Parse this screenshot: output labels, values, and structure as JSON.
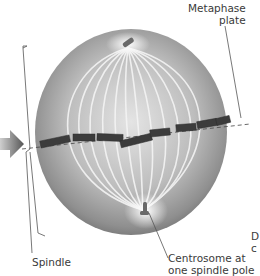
{
  "figure": {
    "labels": {
      "metaphase_plate_line1": "Metaphase",
      "metaphase_plate_line2": "plate",
      "spindle": "Spindle",
      "centrosome_line1": "Centrosome at",
      "centrosome_line2": "one spindle pole",
      "cut_off_line1": "D",
      "cut_off_line2": "c"
    },
    "icons": {
      "arrow": "right-arrow-icon"
    },
    "colors": {
      "cell_dark": "#6f6f6f",
      "cell_light": "#d9d9d9",
      "fibers": "#f2f2f2",
      "chromosomes": "#3c3c3c",
      "text": "#3a3a3a",
      "leader_lines": "#555555"
    }
  }
}
